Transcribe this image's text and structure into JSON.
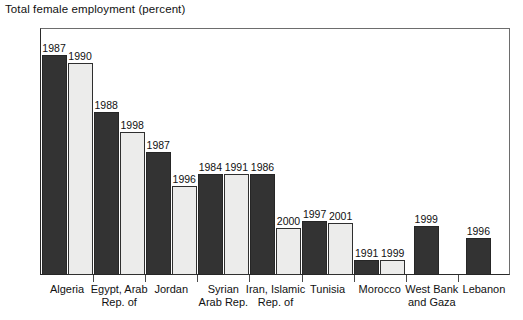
{
  "chart_data": {
    "type": "bar",
    "title": "Total female employment (percent)",
    "xlabel": "",
    "ylabel": "",
    "ylim": [
      0,
      100
    ],
    "ytick_step": 10,
    "yticks": [
      "100",
      "90",
      "80",
      "70",
      "60",
      "50",
      "40",
      "30",
      "20",
      "10",
      "0"
    ],
    "grid": false,
    "legend": "none",
    "note": "Each bar is annotated with its survey year label above the bar.",
    "categories": [
      "Algeria",
      "Egypt, Arab Rep. of",
      "Jordan",
      "Syrian Arab Rep.",
      "Iran, Islamic Rep. of",
      "Tunisia",
      "Morocco",
      "West Bank and Gaza",
      "Lebanon"
    ],
    "category_lines": [
      [
        "Algeria"
      ],
      [
        "Egypt, Arab",
        "Rep. of"
      ],
      [
        "Jordan"
      ],
      [
        "Syrian",
        "Arab Rep."
      ],
      [
        "Iran, Islamic",
        "Rep. of"
      ],
      [
        "Tunisia"
      ],
      [
        "Morocco"
      ],
      [
        "West Bank",
        "and Gaza"
      ],
      [
        "Lebanon"
      ]
    ],
    "groups": [
      {
        "category": "Algeria",
        "bars": [
          {
            "year": "1987",
            "value": 89,
            "style": "dark"
          },
          {
            "year": "1990",
            "value": 86,
            "style": "light"
          }
        ]
      },
      {
        "category": "Egypt, Arab Rep. of",
        "bars": [
          {
            "year": "1988",
            "value": 66,
            "style": "dark"
          },
          {
            "year": "1998",
            "value": 58,
            "style": "light"
          }
        ]
      },
      {
        "category": "Jordan",
        "bars": [
          {
            "year": "1987",
            "value": 50,
            "style": "dark"
          },
          {
            "year": "1996",
            "value": 36,
            "style": "light"
          }
        ]
      },
      {
        "category": "Syrian Arab Rep.",
        "bars": [
          {
            "year": "1984",
            "value": 41,
            "style": "dark"
          },
          {
            "year": "1991",
            "value": 41,
            "style": "light"
          }
        ]
      },
      {
        "category": "Iran, Islamic Rep. of",
        "bars": [
          {
            "year": "1986",
            "value": 41,
            "style": "dark"
          },
          {
            "year": "2000",
            "value": 19,
            "style": "light"
          }
        ]
      },
      {
        "category": "Tunisia",
        "bars": [
          {
            "year": "1997",
            "value": 22,
            "style": "dark"
          },
          {
            "year": "2001",
            "value": 21,
            "style": "light"
          }
        ]
      },
      {
        "category": "Morocco",
        "bars": [
          {
            "year": "1991",
            "value": 6,
            "style": "dark"
          },
          {
            "year": "1999",
            "value": 6,
            "style": "light"
          }
        ]
      },
      {
        "category": "West Bank and Gaza",
        "bars": [
          {
            "year": "1999",
            "value": 20,
            "style": "dark"
          }
        ]
      },
      {
        "category": "Lebanon",
        "bars": [
          {
            "year": "1996",
            "value": 15,
            "style": "dark"
          }
        ]
      }
    ],
    "colors": {
      "bar_dark": "#333333",
      "bar_light": "#ececeb",
      "bar_outline": "#2a2a2a",
      "axis": "#2a2a2a",
      "text": "#111111",
      "background": "#ffffff"
    }
  }
}
